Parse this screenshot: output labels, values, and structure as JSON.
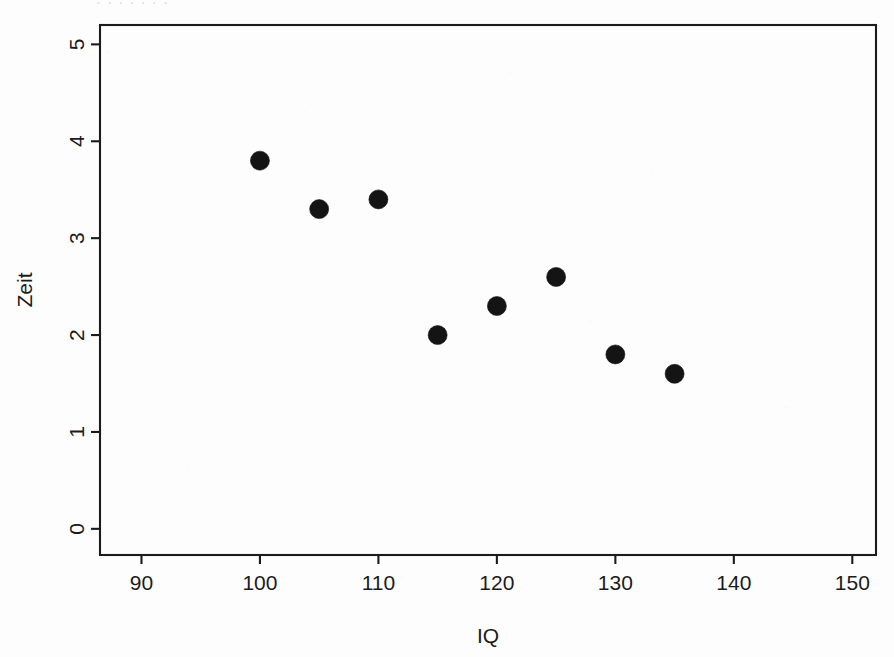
{
  "page": {
    "clipped_header_text": "·   ·        ·                   ·       ·                    ·            ·"
  },
  "chart_data": {
    "type": "scatter",
    "title": "",
    "xlabel": "IQ",
    "ylabel": "Zeit",
    "xlim": [
      86.5,
      152.0
    ],
    "ylim": [
      -0.27,
      5.2
    ],
    "xticks": [
      90,
      100,
      110,
      120,
      130,
      140,
      150
    ],
    "xtick_labels": [
      "90",
      "100",
      "110",
      "120",
      "130",
      "140",
      "150"
    ],
    "yticks": [
      0,
      1,
      2,
      3,
      4,
      5
    ],
    "ytick_labels": [
      "0",
      "1",
      "2",
      "3",
      "4",
      "5"
    ],
    "grid": false,
    "legend": null,
    "frame": "box",
    "tick_direction": "out",
    "marker": "filled-circle",
    "marker_color": "#141414",
    "marker_size": 9.5,
    "x": [
      100,
      105,
      110,
      115,
      120,
      125,
      130,
      135
    ],
    "y": [
      3.8,
      3.3,
      3.4,
      2.0,
      2.3,
      2.6,
      1.8,
      1.6
    ],
    "points": [
      {
        "x": 100,
        "y": 3.8
      },
      {
        "x": 105,
        "y": 3.3
      },
      {
        "x": 110,
        "y": 3.4
      },
      {
        "x": 115,
        "y": 2.0
      },
      {
        "x": 120,
        "y": 2.3
      },
      {
        "x": 125,
        "y": 2.6
      },
      {
        "x": 130,
        "y": 1.8
      },
      {
        "x": 135,
        "y": 1.6
      }
    ]
  },
  "plot_box": {
    "left": 100,
    "right": 876,
    "top": 25,
    "bottom": 555,
    "tick_length": 9
  }
}
